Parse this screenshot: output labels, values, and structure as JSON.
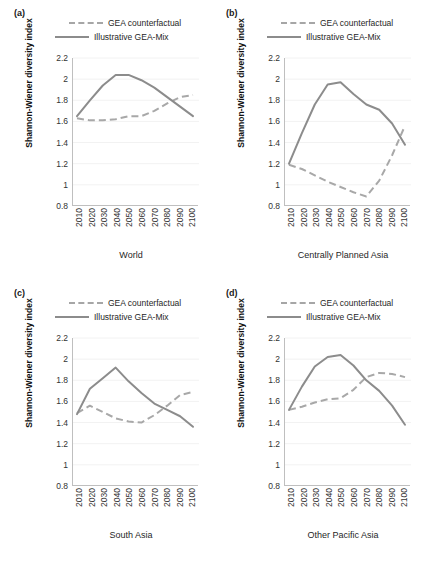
{
  "figure": {
    "shared": {
      "ylabel": "Shannon-Wiener diversity index",
      "yticks": [
        "2.2",
        "2",
        "1.8",
        "1.6",
        "1.4",
        "1.2",
        "1",
        "0.8"
      ],
      "xticks": [
        "2010",
        "2020",
        "2030",
        "2040",
        "2050",
        "2060",
        "2070",
        "2080",
        "2090",
        "2100"
      ],
      "legend": [
        {
          "label": "GEA counterfactual",
          "style": "dashed",
          "color": "#a8a8a8"
        },
        {
          "label": "Illustrative GEA-Mix",
          "style": "solid",
          "color": "#8c8c8c"
        }
      ]
    },
    "panels": [
      {
        "tag": "(a)",
        "xlabel": "World"
      },
      {
        "tag": "(b)",
        "xlabel": "Centrally Planned Asia"
      },
      {
        "tag": "(c)",
        "xlabel": "South Asia"
      },
      {
        "tag": "(d)",
        "xlabel": "Other Pacific Asia"
      }
    ]
  },
  "chart_data": [
    {
      "type": "line",
      "title": "(a) World",
      "xlabel": "World",
      "ylabel": "Shannon-Wiener diversity index",
      "x": [
        2010,
        2020,
        2030,
        2040,
        2050,
        2060,
        2070,
        2080,
        2090,
        2100
      ],
      "ylim": [
        0.8,
        2.2
      ],
      "yticks": [
        0.8,
        1.0,
        1.2,
        1.4,
        1.6,
        1.8,
        2.0,
        2.2
      ],
      "grid": true,
      "legend_position": "above-plot",
      "series": [
        {
          "name": "Illustrative GEA-Mix",
          "style": "solid",
          "color": "#8c8c8c",
          "values": [
            1.65,
            1.8,
            1.94,
            2.04,
            2.04,
            1.99,
            1.92,
            1.83,
            1.74,
            1.65
          ]
        },
        {
          "name": "GEA counterfactual",
          "style": "dashed",
          "color": "#a8a8a8",
          "values": [
            1.63,
            1.61,
            1.61,
            1.62,
            1.65,
            1.65,
            1.7,
            1.77,
            1.83,
            1.85
          ]
        }
      ]
    },
    {
      "type": "line",
      "title": "(b) Centrally Planned Asia",
      "xlabel": "Centrally Planned Asia",
      "ylabel": "Shannon-Wiener diversity index",
      "x": [
        2010,
        2020,
        2030,
        2040,
        2050,
        2060,
        2070,
        2080,
        2090,
        2100
      ],
      "ylim": [
        0.8,
        2.2
      ],
      "yticks": [
        0.8,
        1.0,
        1.2,
        1.4,
        1.6,
        1.8,
        2.0,
        2.2
      ],
      "grid": true,
      "legend_position": "above-plot",
      "series": [
        {
          "name": "Illustrative GEA-Mix",
          "style": "solid",
          "color": "#8c8c8c",
          "values": [
            1.2,
            1.49,
            1.76,
            1.95,
            1.97,
            1.86,
            1.76,
            1.71,
            1.58,
            1.38
          ]
        },
        {
          "name": "GEA counterfactual",
          "style": "dashed",
          "color": "#a8a8a8",
          "values": [
            1.19,
            1.15,
            1.09,
            1.03,
            0.98,
            0.93,
            0.89,
            1.04,
            1.28,
            1.56
          ]
        }
      ]
    },
    {
      "type": "line",
      "title": "(c) South Asia",
      "xlabel": "South Asia",
      "ylabel": "Shannon-Wiener diversity index",
      "x": [
        2010,
        2020,
        2030,
        2040,
        2050,
        2060,
        2070,
        2080,
        2090,
        2100
      ],
      "ylim": [
        0.8,
        2.2
      ],
      "yticks": [
        0.8,
        1.0,
        1.2,
        1.4,
        1.6,
        1.8,
        2.0,
        2.2
      ],
      "grid": true,
      "legend_position": "above-plot",
      "series": [
        {
          "name": "Illustrative GEA-Mix",
          "style": "solid",
          "color": "#8c8c8c",
          "values": [
            1.48,
            1.72,
            1.82,
            1.92,
            1.79,
            1.68,
            1.58,
            1.52,
            1.46,
            1.36
          ]
        },
        {
          "name": "GEA counterfactual",
          "style": "dashed",
          "color": "#a8a8a8",
          "values": [
            1.49,
            1.56,
            1.5,
            1.44,
            1.41,
            1.4,
            1.47,
            1.56,
            1.66,
            1.69
          ]
        }
      ]
    },
    {
      "type": "line",
      "title": "(d) Other Pacific Asia",
      "xlabel": "Other Pacific Asia",
      "ylabel": "Shannon-Wiener diversity index",
      "x": [
        2010,
        2020,
        2030,
        2040,
        2050,
        2060,
        2070,
        2080,
        2090,
        2100
      ],
      "ylim": [
        0.8,
        2.2
      ],
      "yticks": [
        0.8,
        1.0,
        1.2,
        1.4,
        1.6,
        1.8,
        2.0,
        2.2
      ],
      "grid": true,
      "legend_position": "above-plot",
      "series": [
        {
          "name": "Illustrative GEA-Mix",
          "style": "solid",
          "color": "#8c8c8c",
          "values": [
            1.52,
            1.74,
            1.93,
            2.02,
            2.04,
            1.94,
            1.8,
            1.7,
            1.56,
            1.38
          ]
        },
        {
          "name": "GEA counterfactual",
          "style": "dashed",
          "color": "#a8a8a8",
          "values": [
            1.52,
            1.55,
            1.59,
            1.62,
            1.63,
            1.71,
            1.83,
            1.87,
            1.86,
            1.83
          ]
        }
      ]
    }
  ]
}
